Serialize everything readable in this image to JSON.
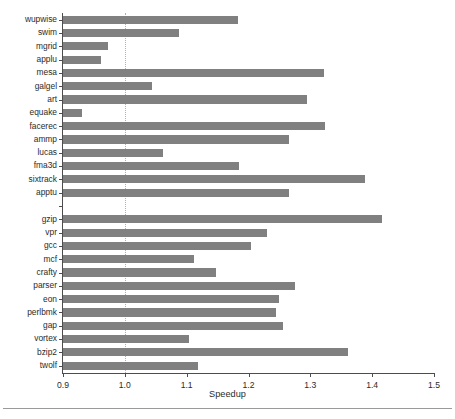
{
  "chart_data": {
    "type": "bar",
    "orientation": "horizontal",
    "title": "",
    "xlabel": "Speedup",
    "ylabel": "",
    "xlim": [
      0.9,
      1.5
    ],
    "xticks": [
      "0.9",
      "1.0",
      "1.1",
      "1.2",
      "1.3",
      "1.4",
      "1.5"
    ],
    "xtick_values": [
      0.9,
      1.0,
      1.1,
      1.2,
      1.3,
      1.4,
      1.5
    ],
    "grid": "vertical dotted gridline at 1.0",
    "legend": "none",
    "bar_color": "#808080",
    "axis_color": "#4d4d4d",
    "baseline": 0.9,
    "reference_line": 1.0,
    "groups": [
      {
        "name": "SPEC CFP2000",
        "categories": [
          "wupwise",
          "swim",
          "mgrid",
          "applu",
          "mesa",
          "galgel",
          "art",
          "equake",
          "facerec",
          "ammp",
          "lucas",
          "fma3d",
          "sixtrack",
          "apptu"
        ],
        "values": [
          1.183,
          1.088,
          0.973,
          0.961,
          1.322,
          1.044,
          1.295,
          0.931,
          1.324,
          1.266,
          1.062,
          1.185,
          1.389,
          1.266
        ]
      },
      {
        "name": "SPEC CINT2000",
        "categories": [
          "gzip",
          "vpr",
          "gcc",
          "mcf",
          "crafty",
          "parser",
          "eon",
          "perlbmk",
          "gap",
          "vortex",
          "bzip2",
          "twolf"
        ],
        "values": [
          1.416,
          1.23,
          1.204,
          1.112,
          1.148,
          1.275,
          1.25,
          1.245,
          1.256,
          1.104,
          1.361,
          1.118
        ]
      }
    ],
    "categories": [
      "wupwise",
      "swim",
      "mgrid",
      "applu",
      "mesa",
      "galgel",
      "art",
      "equake",
      "facerec",
      "ammp",
      "lucas",
      "fma3d",
      "sixtrack",
      "apptu",
      "",
      "gzip",
      "vpr",
      "gcc",
      "mcf",
      "crafty",
      "parser",
      "eon",
      "perlbmk",
      "gap",
      "vortex",
      "bzip2",
      "twolf"
    ],
    "values": [
      1.183,
      1.088,
      0.973,
      0.961,
      1.322,
      1.044,
      1.295,
      0.931,
      1.324,
      1.266,
      1.062,
      1.185,
      1.389,
      1.266,
      null,
      1.416,
      1.23,
      1.204,
      1.112,
      1.148,
      1.275,
      1.25,
      1.245,
      1.256,
      1.104,
      1.361,
      1.118
    ]
  }
}
